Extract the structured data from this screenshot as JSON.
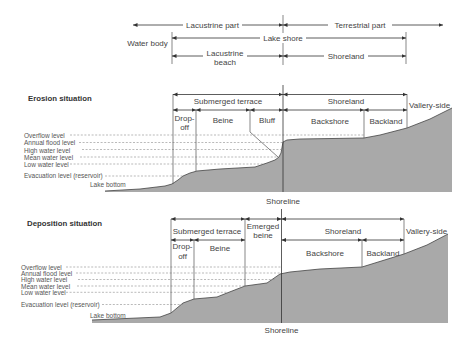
{
  "top": {
    "lacustrine_part": "Lacustrine part",
    "terrestrial_part": "Terrestrial part",
    "water_body": "Water body",
    "lake_shore": "Lake shore",
    "lacustrine_beach": [
      "Lacustrine",
      "beach"
    ],
    "shoreland": "Shoreland"
  },
  "erosion": {
    "title": "Erosion situation",
    "zones_upper": {
      "submerged_terrace": "Submerged terrace",
      "shoreland": "Shoreland"
    },
    "zones_lower": {
      "drop_off": [
        "Drop-",
        "off"
      ],
      "beine": "Beine",
      "bluff": "Bluff",
      "backshore": "Backshore",
      "backland": "Backland"
    },
    "vallery_side": "Vallery-side",
    "levels": [
      "Overflow level",
      "Annual flood level",
      "High water level",
      "Mean water level",
      "Low water level",
      "Evacuation level (reservoir)"
    ],
    "lake_bottom": "Lake bottom",
    "shoreline": "Shoreline"
  },
  "deposition": {
    "title": "Deposition situation",
    "zones_upper": {
      "submerged_terrace": "Submerged terrace",
      "emerged_beine": [
        "Emerged",
        "beine"
      ],
      "shoreland": "Shoreland"
    },
    "zones_lower": {
      "drop_off": [
        "Drop-",
        "off"
      ],
      "beine": "Beine",
      "backshore": "Backshore",
      "backland": "Backland"
    },
    "vallery_side": "Vallery-side",
    "levels": [
      "Overflow level",
      "Annual flood level",
      "High water level",
      "Mean water level",
      "Low water level",
      "Evacuation level (reservoir)"
    ],
    "lake_bottom": "Lake bottom",
    "shoreline": "Shoreline"
  },
  "colors": {
    "terrain_fill": "#a9a9a9",
    "line": "#333333",
    "text": "#444444",
    "dashed": "#8c8c8c"
  }
}
